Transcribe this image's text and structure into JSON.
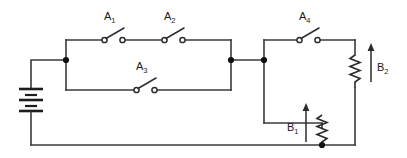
{
  "figure": {
    "kind": "electrical-circuit-schematic",
    "background_color": "#ffffff",
    "line_color": "#2e2e2e",
    "width": 407,
    "height": 158
  },
  "components": {
    "battery": {
      "name": "battery",
      "label": "",
      "symbol": "multi-cell-battery",
      "orientation": "vertical",
      "x": 31,
      "y": 100
    },
    "switches": [
      {
        "id": "A1",
        "label": "A",
        "subscript": "1",
        "state": "open",
        "orientation": "horizontal",
        "branch": "upper-left",
        "x": 113,
        "y": 40
      },
      {
        "id": "A2",
        "label": "A",
        "subscript": "2",
        "state": "open",
        "orientation": "horizontal",
        "branch": "upper-left",
        "x": 173,
        "y": 40
      },
      {
        "id": "A3",
        "label": "A",
        "subscript": "3",
        "state": "open",
        "orientation": "horizontal",
        "branch": "lower-left",
        "x": 145,
        "y": 90
      },
      {
        "id": "A4",
        "label": "A",
        "subscript": "4",
        "state": "open",
        "orientation": "horizontal",
        "branch": "upper-right",
        "x": 308,
        "y": 40
      }
    ],
    "resistors": [
      {
        "id": "B1",
        "label": "B",
        "subscript": "1",
        "symbol": "zigzag-resistor",
        "variable": true,
        "arrow_direction": "up",
        "label_side": "left",
        "orientation": "vertical",
        "x": 322,
        "y": 123
      },
      {
        "id": "B2",
        "label": "B",
        "subscript": "2",
        "symbol": "zigzag-resistor",
        "variable": true,
        "arrow_direction": "up",
        "label_side": "right",
        "orientation": "vertical",
        "x": 355,
        "y": 60
      }
    ],
    "nodes": [
      {
        "id": "node-left",
        "x": 66,
        "y": 60
      },
      {
        "id": "node-mid",
        "x": 231,
        "y": 60
      },
      {
        "id": "node-right",
        "x": 264,
        "y": 60
      },
      {
        "id": "node-bottom",
        "x": 322,
        "y": 145
      }
    ]
  },
  "labels": {
    "a1": {
      "text": "A",
      "sub": "1"
    },
    "a2": {
      "text": "A",
      "sub": "2"
    },
    "a3": {
      "text": "A",
      "sub": "3"
    },
    "a4": {
      "text": "A",
      "sub": "4"
    },
    "b1": {
      "text": "B",
      "sub": "1"
    },
    "b2": {
      "text": "B",
      "sub": "2"
    }
  }
}
